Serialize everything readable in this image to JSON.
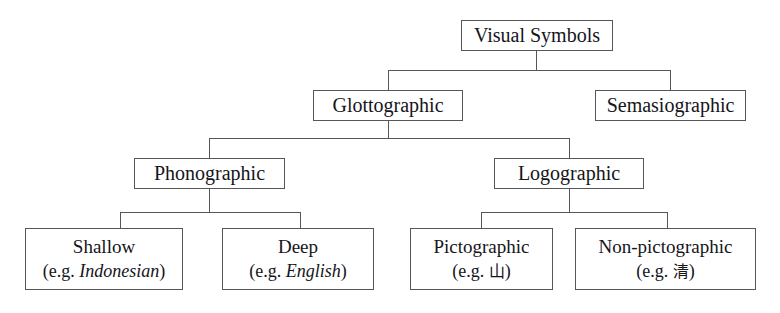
{
  "diagram": {
    "type": "tree",
    "orientation": "top-down",
    "colors": {
      "background": "#ffffff",
      "box_border": "#55555b",
      "connector": "#55555b",
      "text": "#15151a"
    },
    "nodes": {
      "root": {
        "label": "Visual Symbols"
      },
      "glottographic": {
        "label": "Glottographic"
      },
      "semasiographic": {
        "label": "Semasiographic"
      },
      "phonographic": {
        "label": "Phonographic"
      },
      "logographic": {
        "label": "Logographic"
      },
      "shallow": {
        "label": "Shallow",
        "example_prefix": "(e.g. ",
        "example_value": "Indonesian",
        "example_suffix": ")"
      },
      "deep": {
        "label": "Deep",
        "example_prefix": "(e.g. ",
        "example_value": "English",
        "example_suffix": ")"
      },
      "pictographic": {
        "label": "Pictographic",
        "example_prefix": "(e.g. ",
        "example_value": "山",
        "example_suffix": ")"
      },
      "non_pictographic": {
        "label": "Non-pictographic",
        "example_prefix": "(e.g. ",
        "example_value": "清",
        "example_suffix": ")"
      }
    },
    "edges": [
      {
        "from": "root",
        "to": "glottographic"
      },
      {
        "from": "root",
        "to": "semasiographic"
      },
      {
        "from": "glottographic",
        "to": "phonographic"
      },
      {
        "from": "glottographic",
        "to": "logographic"
      },
      {
        "from": "phonographic",
        "to": "shallow"
      },
      {
        "from": "phonographic",
        "to": "deep"
      },
      {
        "from": "logographic",
        "to": "pictographic"
      },
      {
        "from": "logographic",
        "to": "non_pictographic"
      }
    ]
  }
}
